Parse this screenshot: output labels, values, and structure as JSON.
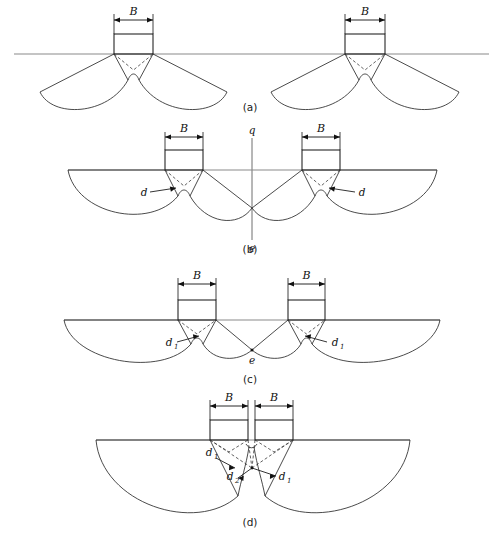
{
  "figure": {
    "ground_color": "#8a8a8a",
    "slip_color": "#2b2b2b",
    "dashed_color": "#3a3a3a"
  },
  "panels": [
    {
      "id": "a",
      "caption": "(a)",
      "description": "Two widely spaced footings with independent, non-overlapping failure zones",
      "footings": [
        {
          "label_B": "B",
          "x_left": 114,
          "x_right": 153
        },
        {
          "label_B": "B",
          "x_left": 345,
          "x_right": 385
        }
      ],
      "annotations": []
    },
    {
      "id": "b",
      "caption": "(b)",
      "description": "Footings spaced so that outer failure surfaces just meet at the centreline",
      "footings": [
        {
          "label_B": "B",
          "x_left": 165,
          "x_right": 203
        },
        {
          "label_B": "B",
          "x_left": 302,
          "x_right": 340
        }
      ],
      "annotations": [
        {
          "name": "q",
          "text": "q",
          "role": "axis-top-label"
        },
        {
          "name": "e",
          "text": "e",
          "role": "axis-bottom-label"
        },
        {
          "name": "d-left",
          "text": "d",
          "role": "slip-depth-label"
        },
        {
          "name": "d-right",
          "text": "d",
          "role": "slip-depth-label"
        }
      ]
    },
    {
      "id": "c",
      "caption": "(c)",
      "description": "Closer spacing; inner failure surfaces intersect at point e below ground",
      "footings": [
        {
          "label_B": "B",
          "x_left": 178,
          "x_right": 216
        },
        {
          "label_B": "B",
          "x_left": 288,
          "x_right": 325
        }
      ],
      "annotations": [
        {
          "name": "d1-left",
          "text": "d",
          "sub": "1",
          "role": "slip-depth-label"
        },
        {
          "name": "d1-right",
          "text": "d",
          "sub": "1",
          "role": "slip-depth-label"
        },
        {
          "name": "e",
          "text": "e",
          "role": "intersection-point-label"
        }
      ]
    },
    {
      "id": "d",
      "caption": "(d)",
      "description": "Nearly touching footings acting as a single wide foundation with a deep combined failure zone",
      "footings": [
        {
          "label_B": "B",
          "x_left": 210,
          "x_right": 248
        },
        {
          "label_B": "B",
          "x_left": 255,
          "x_right": 293
        }
      ],
      "annotations": [
        {
          "name": "d1-left",
          "text": "d",
          "sub": "1",
          "role": "slip-depth-label"
        },
        {
          "name": "d2-center",
          "text": "d",
          "sub": "2",
          "role": "slip-depth-label"
        },
        {
          "name": "d1-right",
          "text": "d",
          "sub": "1",
          "role": "slip-depth-label"
        }
      ]
    }
  ]
}
